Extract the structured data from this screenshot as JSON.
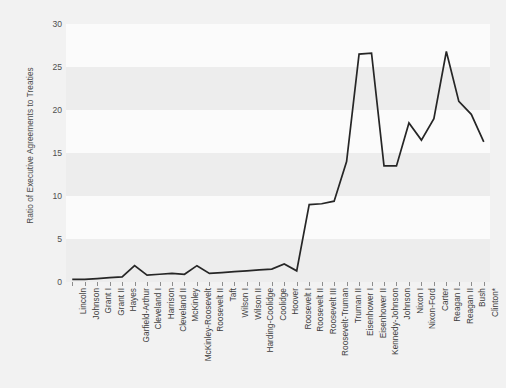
{
  "figure": {
    "background_color": "#f2f2f2",
    "plot_background_color": "#fbfbfb",
    "band_color": "#ededed",
    "line_color": "#262626",
    "tick_color": "#8d8d8d"
  },
  "chart_data": {
    "type": "line",
    "title": "",
    "xlabel": "",
    "ylabel": "Ratio of Executive Agreements to Treaties",
    "ylim": [
      0,
      30
    ],
    "yticks": [
      0,
      5,
      10,
      15,
      20,
      25,
      30
    ],
    "ytick_labels": [
      "0",
      "5",
      "10",
      "15",
      "20",
      "25",
      "30"
    ],
    "grid": false,
    "banded_background": true,
    "legend": null,
    "legend_position": "none",
    "categories": [
      "Lincoln",
      "Johnson",
      "Grant I",
      "Grant II",
      "Hayes",
      "Garfield-Arthur",
      "Cleveland I",
      "Harrison",
      "Cleveland II",
      "McKinley",
      "McKinley-Roosevelt",
      "Roosevelt II",
      "Taft",
      "Wilson I",
      "Wilson II",
      "Harding-Coolidge",
      "Coolidge",
      "Hoover",
      "Roosevelt I",
      "Roosevelt II",
      "Roosevelt III",
      "Roosevelt-Truman",
      "Truman II",
      "Eisenhower I",
      "Eisenhower II",
      "Kennedy-Johnson",
      "Johnson",
      "Nixon I",
      "Nixon-Ford",
      "Carter",
      "Reagan I",
      "Reagan II",
      "Bush",
      "Clinton*"
    ],
    "values": [
      0.3,
      0.3,
      0.4,
      0.5,
      0.6,
      1.9,
      0.8,
      0.9,
      1.0,
      0.9,
      1.9,
      1.0,
      1.1,
      1.2,
      1.3,
      1.4,
      1.5,
      2.1,
      1.3,
      9.0,
      9.1,
      9.4,
      14.0,
      26.5,
      26.6,
      13.5,
      13.5,
      18.5,
      16.5,
      19.0,
      26.8,
      21.0,
      19.5,
      16.3
    ]
  }
}
